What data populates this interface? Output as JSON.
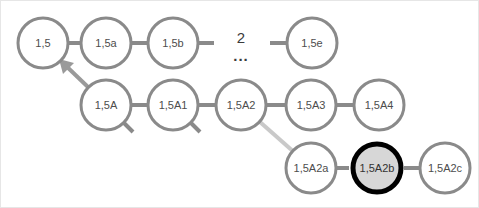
{
  "diagram": {
    "type": "node-link-graph",
    "background_color": "#ffffff",
    "node_stroke_color": "#8a8a8a",
    "node_fill_color": "#ffffff",
    "edge_color": "#8a8a8a",
    "faint_edge_color": "#c9c9c9",
    "highlight_stroke_color": "#000000",
    "highlight_fill_color": "#d7d7d7",
    "label_color": "#4d4d4d",
    "node_radius": 26,
    "node_stroke_width": 3,
    "highlight_stroke_width": 5,
    "rows": [
      {
        "name": "top-row",
        "cy": 42,
        "nodes": [
          {
            "id": "n-1-5",
            "label": "1,5",
            "cx": 42,
            "highlighted": false
          },
          {
            "id": "n-1-5a",
            "label": "1,5a",
            "cx": 105,
            "highlighted": false
          },
          {
            "id": "n-1-5b",
            "label": "1,5b",
            "cx": 172,
            "highlighted": false
          },
          {
            "id": "n-1-5e",
            "label": "1,5e",
            "cx": 311,
            "highlighted": false
          }
        ]
      },
      {
        "name": "middle-row",
        "cy": 104,
        "nodes": [
          {
            "id": "n-1-5A",
            "label": "1,5A",
            "cx": 105,
            "highlighted": false
          },
          {
            "id": "n-1-5A1",
            "label": "1,5A1",
            "cx": 172,
            "highlighted": false
          },
          {
            "id": "n-1-5A2",
            "label": "1,5A2",
            "cx": 240,
            "highlighted": false
          },
          {
            "id": "n-1-5A3",
            "label": "1,5A3",
            "cx": 310,
            "highlighted": false
          },
          {
            "id": "n-1-5A4",
            "label": "1,5A4",
            "cx": 378,
            "highlighted": false
          }
        ]
      },
      {
        "name": "bottom-row",
        "cy": 167,
        "nodes": [
          {
            "id": "n-1-5A2a",
            "label": "1,5A2a",
            "cx": 310,
            "highlighted": false
          },
          {
            "id": "n-1-5A2b",
            "label": "1,5A2b",
            "cx": 376,
            "highlighted": true
          },
          {
            "id": "n-1-5A2c",
            "label": "1,5A2c",
            "cx": 444,
            "highlighted": false
          }
        ]
      }
    ],
    "gap_marker": {
      "name": "sequence-gap-marker",
      "number": "2",
      "ellipsis": "...",
      "x": 240,
      "number_y": 38,
      "ellipsis_y": 56
    },
    "edges": [
      {
        "name": "edge-1-5-to-1-5a",
        "from": "n-1-5",
        "to": "n-1-5a",
        "style": "solid"
      },
      {
        "name": "edge-1-5a-to-1-5b",
        "from": "n-1-5a",
        "to": "n-1-5b",
        "style": "solid"
      },
      {
        "name": "edge-1-5b-stub-right",
        "from": "n-1-5b",
        "to": "gap",
        "style": "stub"
      },
      {
        "name": "edge-gap-stub-to-1-5e",
        "from": "gap",
        "to": "n-1-5e",
        "style": "stub"
      },
      {
        "name": "edge-1-5A-to-1-5",
        "from": "n-1-5A",
        "to": "n-1-5",
        "style": "arrow"
      },
      {
        "name": "edge-1-5A-to-1-5A1",
        "from": "n-1-5A",
        "to": "n-1-5A1",
        "style": "solid"
      },
      {
        "name": "edge-1-5A1-to-1-5A2",
        "from": "n-1-5A1",
        "to": "n-1-5A2",
        "style": "solid"
      },
      {
        "name": "edge-1-5A2-to-1-5A3",
        "from": "n-1-5A2",
        "to": "n-1-5A3",
        "style": "solid"
      },
      {
        "name": "edge-1-5A3-to-1-5A4",
        "from": "n-1-5A3",
        "to": "n-1-5A4",
        "style": "solid"
      },
      {
        "name": "edge-1-5A2-to-1-5A2a",
        "from": "n-1-5A2",
        "to": "n-1-5A2a",
        "style": "faint-diagonal"
      },
      {
        "name": "edge-1-5A2a-to-1-5A2b",
        "from": "n-1-5A2a",
        "to": "n-1-5A2b",
        "style": "solid"
      },
      {
        "name": "edge-1-5A2b-to-1-5A2c",
        "from": "n-1-5A2b",
        "to": "n-1-5A2c",
        "style": "solid"
      },
      {
        "name": "stub-below-1-5A",
        "from": "n-1-5A",
        "to": null,
        "style": "short-stub-diagonal"
      },
      {
        "name": "stub-below-1-5A1",
        "from": "n-1-5A1",
        "to": null,
        "style": "short-stub-diagonal"
      }
    ]
  }
}
